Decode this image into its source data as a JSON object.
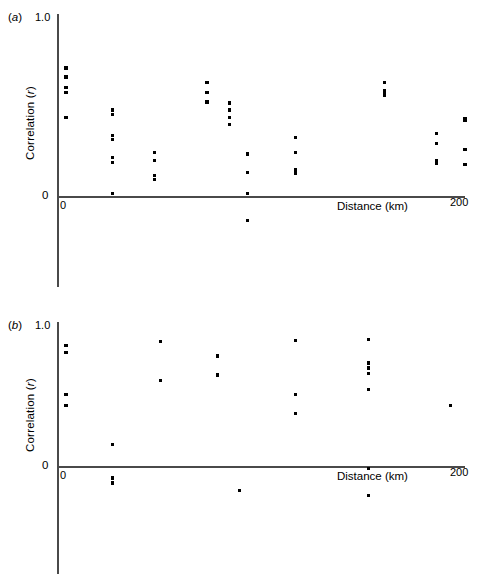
{
  "figure": {
    "kind": "two-panel scatter plot",
    "background": "#ffffff",
    "point_color": "#000000",
    "axis_color": "#4a4a4a"
  },
  "chart_data": [
    {
      "type": "scatter",
      "panel": "(a)",
      "panel_label_letter": "a",
      "title": "",
      "xlabel": "Distance (km)",
      "ylabel": "Correlation (r)",
      "ylabel_text": "Correlation (",
      "ylabel_italic": "r",
      "ylabel_tail": ")",
      "xlim": [
        0,
        200
      ],
      "ylim": [
        -0.25,
        1.0
      ],
      "xticks": [
        0,
        200
      ],
      "xticklabels": [
        "0",
        "200"
      ],
      "yticks": [
        0,
        1.0
      ],
      "yticklabels": [
        "0",
        "1.0"
      ],
      "grid": false,
      "legend": "none",
      "points": [
        {
          "x": 2,
          "y": 0.715
        },
        {
          "x": 2,
          "y": 0.665
        },
        {
          "x": 2,
          "y": 0.605
        },
        {
          "x": 2,
          "y": 0.58
        },
        {
          "x": 2,
          "y": 0.44
        },
        {
          "x": 25,
          "y": 0.48
        },
        {
          "x": 25,
          "y": 0.455
        },
        {
          "x": 25,
          "y": 0.34
        },
        {
          "x": 25,
          "y": 0.315
        },
        {
          "x": 25,
          "y": 0.215
        },
        {
          "x": 25,
          "y": 0.185
        },
        {
          "x": 25,
          "y": 0.015
        },
        {
          "x": 46,
          "y": 0.245
        },
        {
          "x": 46,
          "y": 0.2
        },
        {
          "x": 46,
          "y": 0.115
        },
        {
          "x": 46,
          "y": 0.09
        },
        {
          "x": 72,
          "y": 0.635
        },
        {
          "x": 72,
          "y": 0.58
        },
        {
          "x": 72,
          "y": 0.525
        },
        {
          "x": 83,
          "y": 0.52
        },
        {
          "x": 83,
          "y": 0.48
        },
        {
          "x": 83,
          "y": 0.44
        },
        {
          "x": 83,
          "y": 0.4
        },
        {
          "x": 92,
          "y": 0.235
        },
        {
          "x": 92,
          "y": 0.13
        },
        {
          "x": 92,
          "y": 0.015
        },
        {
          "x": 92,
          "y": -0.135
        },
        {
          "x": 116,
          "y": 0.325
        },
        {
          "x": 116,
          "y": 0.245
        },
        {
          "x": 116,
          "y": 0.145
        },
        {
          "x": 116,
          "y": 0.125
        },
        {
          "x": 160,
          "y": 0.635
        },
        {
          "x": 160,
          "y": 0.59
        },
        {
          "x": 160,
          "y": 0.575
        },
        {
          "x": 160,
          "y": 0.56
        },
        {
          "x": 186,
          "y": 0.35
        },
        {
          "x": 186,
          "y": 0.295
        },
        {
          "x": 186,
          "y": 0.195
        },
        {
          "x": 186,
          "y": 0.18
        },
        {
          "x": 200,
          "y": 0.435
        },
        {
          "x": 200,
          "y": 0.42
        },
        {
          "x": 200,
          "y": 0.26
        },
        {
          "x": 200,
          "y": 0.175
        }
      ]
    },
    {
      "type": "scatter",
      "panel": "(b)",
      "panel_label_letter": "b",
      "title": "",
      "xlabel": "Distance (km)",
      "ylabel": "Correlation (r)",
      "ylabel_text": "Correlation (",
      "ylabel_italic": "r",
      "ylabel_tail": ")",
      "xlim": [
        0,
        200
      ],
      "ylim": [
        -0.35,
        1.0
      ],
      "xticks": [
        0,
        200
      ],
      "xticklabels": [
        "0",
        "200"
      ],
      "yticks": [
        0,
        1.0
      ],
      "yticklabels": [
        "0",
        "1.0"
      ],
      "grid": false,
      "legend": "none",
      "points": [
        {
          "x": 2,
          "y": 0.855
        },
        {
          "x": 2,
          "y": 0.805
        },
        {
          "x": 2,
          "y": 0.505
        },
        {
          "x": 2,
          "y": 0.43
        },
        {
          "x": 25,
          "y": 0.155
        },
        {
          "x": 25,
          "y": -0.085
        },
        {
          "x": 25,
          "y": -0.12
        },
        {
          "x": 49,
          "y": 0.885
        },
        {
          "x": 49,
          "y": 0.605
        },
        {
          "x": 77,
          "y": 0.78
        },
        {
          "x": 77,
          "y": 0.645
        },
        {
          "x": 88,
          "y": -0.175
        },
        {
          "x": 116,
          "y": 0.89
        },
        {
          "x": 116,
          "y": 0.505
        },
        {
          "x": 116,
          "y": 0.37
        },
        {
          "x": 152,
          "y": 0.895
        },
        {
          "x": 152,
          "y": 0.73
        },
        {
          "x": 152,
          "y": 0.695
        },
        {
          "x": 152,
          "y": 0.655
        },
        {
          "x": 152,
          "y": 0.54
        },
        {
          "x": 152,
          "y": -0.015
        },
        {
          "x": 152,
          "y": -0.21
        },
        {
          "x": 193,
          "y": 0.43
        }
      ]
    }
  ]
}
